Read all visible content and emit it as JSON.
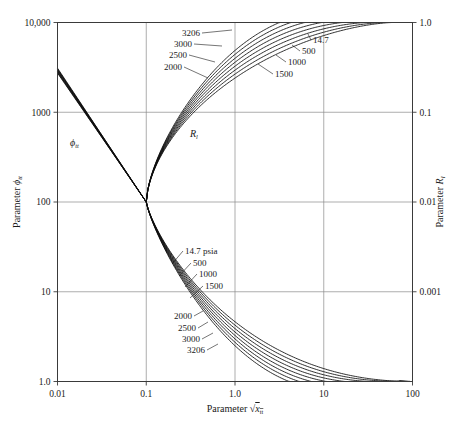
{
  "chart_data": {
    "type": "line",
    "title": "",
    "xlabel": "Parameter √x_tt",
    "xlabel_parts": {
      "prefix": "Parameter",
      "radicand": "x",
      "radicand_sub": "tt"
    },
    "ylabel_left": "Parameter ϕ_tt",
    "ylabel_left_parts": {
      "prefix": "Parameter",
      "symbol": "ϕ",
      "symbol_sub": "tt"
    },
    "ylabel_right": "Parameter R_l",
    "ylabel_right_parts": {
      "prefix": "Parameter",
      "symbol": "R",
      "symbol_sub": "l"
    },
    "xscale": "log",
    "yscale": "log",
    "xlim": [
      0.01,
      100
    ],
    "ylim_left": [
      1.0,
      10000
    ],
    "ylim_right": [
      0.0001,
      1.0
    ],
    "grid": true,
    "legend_position": "inline-annotations",
    "xticks": [
      "0.01",
      "0.1",
      "1.0",
      "10",
      "100"
    ],
    "xtick_values": [
      0.01,
      0.1,
      1,
      10,
      100
    ],
    "yticks_left": [
      "1.0",
      "10",
      "100",
      "1000",
      "10,000"
    ],
    "ytick_values_left": [
      1,
      10,
      100,
      1000,
      10000
    ],
    "yticks_right": [
      "0.001",
      "0.01",
      "0.1",
      "1.0"
    ],
    "ytick_values_right": [
      0.001,
      0.01,
      0.1,
      1.0
    ],
    "inplot_annotations": [
      {
        "name": "phi-tt-annotation",
        "symbol": "ϕ",
        "sub": "tt",
        "x": 0.018,
        "y": 520
      },
      {
        "name": "rl-annotation",
        "symbol": "R",
        "sub": "l",
        "x": 0.3,
        "y": 480
      }
    ],
    "pressure_unit": "psia",
    "pressures": [
      14.7,
      500,
      1000,
      1500,
      2000,
      2500,
      3000,
      3206
    ],
    "series": [
      {
        "name": "14.7 psia",
        "pressure": 14.7,
        "family": "Rl",
        "label": "14.7"
      },
      {
        "name": "500",
        "pressure": 500,
        "family": "Rl",
        "label": "500"
      },
      {
        "name": "1000",
        "pressure": 1000,
        "family": "Rl",
        "label": "1000"
      },
      {
        "name": "1500",
        "pressure": 1500,
        "family": "Rl",
        "label": "1500"
      },
      {
        "name": "2000",
        "pressure": 2000,
        "family": "Rl",
        "label": "2000"
      },
      {
        "name": "2500",
        "pressure": 2500,
        "family": "Rl",
        "label": "2500"
      },
      {
        "name": "3000",
        "pressure": 3000,
        "family": "Rl",
        "label": "3000"
      },
      {
        "name": "3206",
        "pressure": 3206,
        "family": "Rl",
        "label": "3206"
      },
      {
        "name": "14.7 psia",
        "pressure": 14.7,
        "family": "phi",
        "label": "14.7 psia"
      },
      {
        "name": "500",
        "pressure": 500,
        "family": "phi",
        "label": "500"
      },
      {
        "name": "1000",
        "pressure": 1000,
        "family": "phi",
        "label": "1000"
      },
      {
        "name": "1500",
        "pressure": 1500,
        "family": "phi",
        "label": "1500"
      },
      {
        "name": "2000",
        "pressure": 2000,
        "family": "phi",
        "label": "2000"
      },
      {
        "name": "2500",
        "pressure": 2500,
        "family": "phi",
        "label": "2500"
      },
      {
        "name": "3000",
        "pressure": 3000,
        "family": "phi",
        "label": "3000"
      },
      {
        "name": "3206",
        "pressure": 3206,
        "family": "phi",
        "label": "3206"
      }
    ],
    "upper_labels": [
      {
        "text": "3206",
        "x": 200,
        "y": 36,
        "anchor": "end",
        "leader_to_x": 232,
        "leader_to_y": 30
      },
      {
        "text": "3000",
        "x": 192,
        "y": 47,
        "anchor": "end",
        "leader_to_x": 222,
        "leader_to_y": 46
      },
      {
        "text": "2500",
        "x": 187,
        "y": 58,
        "anchor": "end",
        "leader_to_x": 215,
        "leader_to_y": 62
      },
      {
        "text": "2000",
        "x": 182,
        "y": 70,
        "anchor": "end",
        "leader_to_x": 208,
        "leader_to_y": 78
      },
      {
        "text": "14.7",
        "x": 313,
        "y": 43,
        "anchor": "start",
        "leader_to_x": 308,
        "leader_to_y": 34
      },
      {
        "text": "500",
        "x": 302,
        "y": 54,
        "anchor": "start",
        "leader_to_x": 292,
        "leader_to_y": 45
      },
      {
        "text": "1000",
        "x": 288,
        "y": 65,
        "anchor": "start",
        "leader_to_x": 276,
        "leader_to_y": 55
      },
      {
        "text": "1500",
        "x": 275,
        "y": 77,
        "anchor": "start",
        "leader_to_x": 258,
        "leader_to_y": 64
      }
    ],
    "lower_labels": [
      {
        "text": "14.7 psia",
        "x": 185,
        "y": 254,
        "anchor": "start",
        "leader_to_x": 172,
        "leader_to_y": 264
      },
      {
        "text": "500",
        "x": 193,
        "y": 266,
        "anchor": "start",
        "leader_to_x": 179,
        "leader_to_y": 276
      },
      {
        "text": "1000",
        "x": 199,
        "y": 277,
        "anchor": "start",
        "leader_to_x": 185,
        "leader_to_y": 287
      },
      {
        "text": "1500",
        "x": 205,
        "y": 289,
        "anchor": "start",
        "leader_to_x": 190,
        "leader_to_y": 298
      },
      {
        "text": "2000",
        "x": 192,
        "y": 319,
        "anchor": "end",
        "leader_to_x": 203,
        "leader_to_y": 311
      },
      {
        "text": "2500",
        "x": 196,
        "y": 331,
        "anchor": "end",
        "leader_to_x": 208,
        "leader_to_y": 322
      },
      {
        "text": "3000",
        "x": 200,
        "y": 342,
        "anchor": "end",
        "leader_to_x": 213,
        "leader_to_y": 333
      },
      {
        "text": "3206",
        "x": 205,
        "y": 353,
        "anchor": "end",
        "leader_to_x": 218,
        "leader_to_y": 344
      }
    ],
    "notes": [
      "Rl family: rises from pinch point (x=0.1, Rl=0.01) toward Rl=1.0 near x=10",
      "phi_tt family: falls from ~3000 at x=0.01 through pinch (x=0.1, phi=100) to 1.0 near x=30",
      "Curves converge tightly at x=0.1 and spread with pressure"
    ]
  }
}
